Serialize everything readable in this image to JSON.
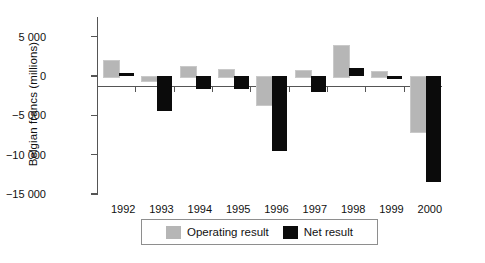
{
  "chart_data": {
    "type": "bar",
    "title": "",
    "subtitle": "",
    "xlabel": "",
    "ylabel": "Belgian francs (millions)",
    "categories": [
      "1992",
      "1993",
      "1994",
      "1995",
      "1996",
      "1997",
      "1998",
      "1999",
      "2000"
    ],
    "series": [
      {
        "name": "Operating result",
        "color": "#b6b6b6",
        "values": [
          2000,
          -500,
          1300,
          900,
          -3500,
          700,
          3900,
          600,
          -7000
        ]
      },
      {
        "name": "Net result",
        "color": "#0b0b0b",
        "values": [
          400,
          -4500,
          -1600,
          -1600,
          -9500,
          -2000,
          1000,
          -400,
          -13500
        ]
      }
    ],
    "ylim": [
      -15000,
      7500
    ],
    "yticks": [
      5000,
      0,
      -5000,
      -10000,
      -15000
    ],
    "ytick_labels": [
      "5 000",
      "0",
      "−5 000",
      "−10 000",
      "−15 000"
    ],
    "grid": false,
    "legend_position": "bottom"
  },
  "legend": {
    "entries": [
      {
        "label": "Operating result",
        "swatch": "operating-swatch"
      },
      {
        "label": "Net result",
        "swatch": "net-swatch"
      }
    ]
  }
}
